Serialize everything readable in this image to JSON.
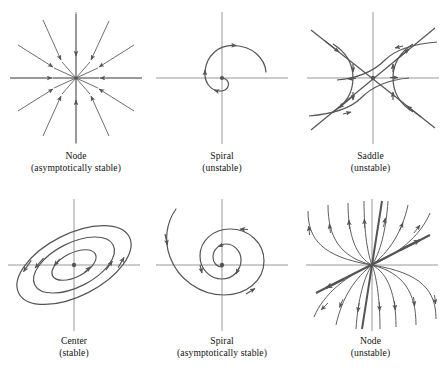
{
  "figure": {
    "background_color": "#ffffff",
    "stroke_color": "#555555",
    "axis_color": "#808080",
    "text_color": "#111111",
    "rows": 2,
    "columns": 3
  },
  "panels": [
    {
      "id": "node-asymptotically-stable",
      "type": "node",
      "stability": "asymptotically stable",
      "caption_line1": "Node",
      "caption_line2": "(asymptotically stable)",
      "flow_direction": "inward",
      "ray_count": 12,
      "origin": {
        "x": 76,
        "y": 78
      }
    },
    {
      "id": "spiral-unstable",
      "type": "spiral",
      "stability": "unstable",
      "caption_line1": "Spiral",
      "caption_line2": "(unstable)",
      "flow_direction": "outward",
      "rotation": "counterclockwise",
      "turns": 1.6,
      "origin": {
        "x": 222,
        "y": 78
      }
    },
    {
      "id": "saddle-unstable",
      "type": "saddle",
      "stability": "unstable",
      "caption_line1": "Saddle",
      "caption_line2": "(unstable)",
      "flow_direction": "in along stable axis, out along unstable axis",
      "separatrices": 2,
      "origin": {
        "x": 373,
        "y": 78
      }
    },
    {
      "id": "center-stable",
      "type": "center",
      "stability": "stable",
      "caption_line1": "Center",
      "caption_line2": "(stable)",
      "flow_direction": "closed orbits",
      "rotation": "counterclockwise",
      "orbit_count": 3,
      "tilt_degrees": -27,
      "origin": {
        "x": 74,
        "y": 265
      }
    },
    {
      "id": "spiral-asymptotically-stable",
      "type": "spiral",
      "stability": "asymptotically stable",
      "caption_line1": "Spiral",
      "caption_line2": "(asymptotically stable)",
      "flow_direction": "inward",
      "rotation": "clockwise",
      "turns": 2.4,
      "origin": {
        "x": 222,
        "y": 265
      }
    },
    {
      "id": "node-unstable",
      "type": "node",
      "stability": "unstable",
      "caption_line1": "Node",
      "caption_line2": "(unstable)",
      "flow_direction": "outward",
      "trajectory_count": 12,
      "origin": {
        "x": 372,
        "y": 265
      }
    }
  ]
}
